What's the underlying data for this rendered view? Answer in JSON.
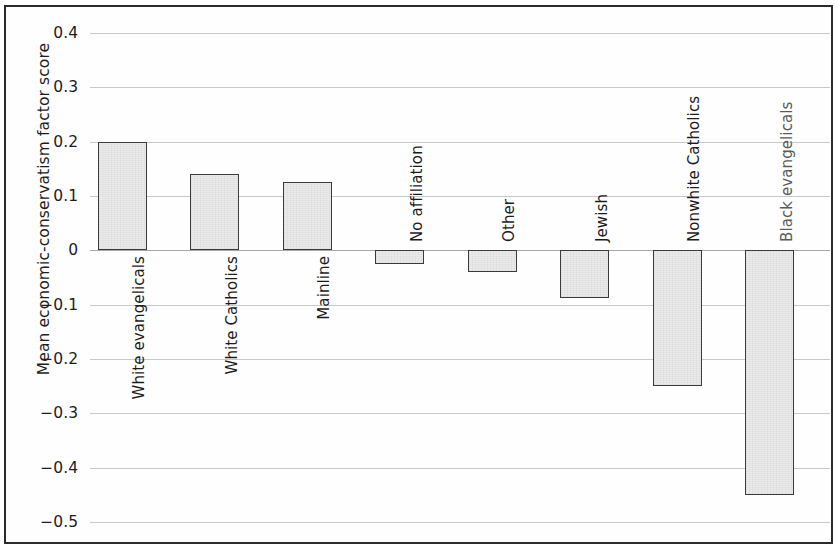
{
  "chart_data": {
    "type": "bar",
    "title": "",
    "subtitle": "",
    "xlabel": "",
    "ylabel": "Mean economic-conservatism factor score",
    "ylim": [
      -0.5,
      0.4
    ],
    "ytick_labels": [
      "0.4",
      "0.3",
      "0.2",
      "0.1",
      "0",
      "−0.1",
      "−0.2",
      "−0.3",
      "−0.4",
      "−0.5"
    ],
    "yticks": [
      0.4,
      0.3,
      0.2,
      0.1,
      0,
      -0.1,
      -0.2,
      -0.3,
      -0.4,
      -0.5
    ],
    "grid": true,
    "legend": false,
    "bar_fill_color": "#ebebeb",
    "bar_edge_color": "#3a3a3a",
    "gridline_color": "#c9c9c9",
    "categories": [
      "White evangelicals",
      "White Catholics",
      "Mainline",
      "No affiliation",
      "Other",
      "Jewish",
      "Nonwhite Catholics",
      "Black evangelicals"
    ],
    "values": [
      0.2,
      0.14,
      0.125,
      -0.025,
      -0.04,
      -0.087,
      -0.25,
      -0.45
    ]
  }
}
